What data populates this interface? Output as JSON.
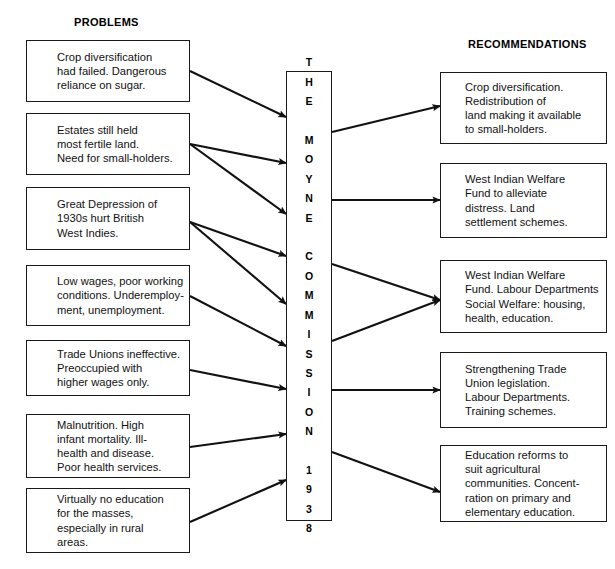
{
  "diagram": {
    "title_left": "PROBLEMS",
    "title_right": "RECOMMENDATIONS",
    "center_label": "T\nH\nE\n\nM\nO\nY\nN\nE\n\nC\nO\nM\nM\nI\nS\nS\nI\nO\nN\n\n1\n9\n3\n8",
    "center_label_plain": "THE MOYNE COMMISSION 1938",
    "line_color": "#111111",
    "box_border_color": "#1a1a1a",
    "background_color": "#ffffff"
  },
  "problems": [
    {
      "id": "problem-crop-diversification",
      "text": "Crop diversification\nhad failed. Dangerous\nreliance on sugar."
    },
    {
      "id": "problem-estates-land",
      "text": "Estates still held\nmost fertile land.\nNeed for small-holders."
    },
    {
      "id": "problem-great-depression",
      "text": "Great Depression of\n1930s hurt British\nWest Indies."
    },
    {
      "id": "problem-low-wages",
      "text": "Low wages, poor working\nconditions. Underemploy-\nment, unemployment."
    },
    {
      "id": "problem-trade-unions",
      "text": "Trade Unions ineffective.\nPreoccupied with\nhigher wages only."
    },
    {
      "id": "problem-malnutrition",
      "text": "Malnutrition. High\ninfant mortality. Ill-\nhealth and disease.\nPoor health services."
    },
    {
      "id": "problem-no-education",
      "text": "Virtually no education\nfor the masses,\nespecially in rural\nareas."
    }
  ],
  "recommendations": [
    {
      "id": "recommendation-crop-diversification",
      "text": "Crop diversification.\nRedistribution of\nland making it available\nto small-holders."
    },
    {
      "id": "recommendation-welfare-fund",
      "text": "West Indian Welfare\nFund to alleviate\ndistress. Land\nsettlement schemes."
    },
    {
      "id": "recommendation-labour-departments",
      "text": "West Indian Welfare\nFund. Labour Departments\nSocial Welfare: housing,\nhealth, education."
    },
    {
      "id": "recommendation-trade-union-law",
      "text": "Strengthening Trade\nUnion legislation.\nLabour Departments.\nTraining schemes."
    },
    {
      "id": "recommendation-education-reform",
      "text": "Education reforms to\nsuit agricultural\ncommunities. Concent-\nration on primary and\nelementary education."
    }
  ]
}
